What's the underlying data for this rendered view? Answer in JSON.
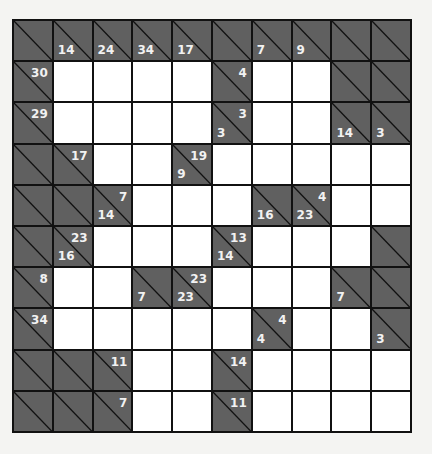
{
  "puzzle": {
    "type": "kakuro",
    "rows": 10,
    "cols": 10,
    "colors": {
      "block": "#606060",
      "empty": "#ffffff",
      "grid": "#111111",
      "clue_text": "#f2f2f2"
    },
    "grid": [
      [
        {
          "b": 1
        },
        {
          "b": 1,
          "d": "14"
        },
        {
          "b": 1,
          "d": "24"
        },
        {
          "b": 1,
          "d": "34"
        },
        {
          "b": 1,
          "d": "17"
        },
        {
          "b": 1
        },
        {
          "b": 1,
          "d": "7"
        },
        {
          "b": 1,
          "d": "9"
        },
        {
          "b": 1
        },
        {
          "b": 1
        }
      ],
      [
        {
          "b": 1,
          "a": "30"
        },
        {},
        {},
        {},
        {},
        {
          "b": 1,
          "a": "4"
        },
        {},
        {},
        {
          "b": 1
        },
        {
          "b": 1
        }
      ],
      [
        {
          "b": 1,
          "a": "29"
        },
        {},
        {},
        {},
        {},
        {
          "b": 1,
          "d": "3",
          "a": "3"
        },
        {},
        {},
        {
          "b": 1,
          "d": "14"
        },
        {
          "b": 1,
          "d": "3"
        }
      ],
      [
        {
          "b": 1
        },
        {
          "b": 1,
          "a": "17"
        },
        {},
        {},
        {
          "b": 1,
          "d": "9",
          "a": "19"
        },
        {},
        {},
        {},
        {},
        {}
      ],
      [
        {
          "b": 1
        },
        {
          "b": 1
        },
        {
          "b": 1,
          "d": "14",
          "a": "7"
        },
        {},
        {},
        {},
        {
          "b": 1,
          "d": "16"
        },
        {
          "b": 1,
          "d": "23",
          "a": "4"
        },
        {},
        {}
      ],
      [
        {
          "b": 1
        },
        {
          "b": 1,
          "d": "16",
          "a": "23"
        },
        {},
        {},
        {},
        {
          "b": 1,
          "d": "14",
          "a": "13"
        },
        {},
        {},
        {},
        {
          "b": 1
        }
      ],
      [
        {
          "b": 1,
          "a": "8"
        },
        {},
        {},
        {
          "b": 1,
          "d": "7"
        },
        {
          "b": 1,
          "d": "23",
          "a": "23"
        },
        {},
        {},
        {},
        {
          "b": 1,
          "d": "7"
        },
        {
          "b": 1
        }
      ],
      [
        {
          "b": 1,
          "a": "34"
        },
        {},
        {},
        {},
        {},
        {},
        {
          "b": 1,
          "d": "4",
          "a": "4"
        },
        {},
        {},
        {
          "b": 1,
          "d": "3"
        }
      ],
      [
        {
          "b": 1
        },
        {
          "b": 1
        },
        {
          "b": 1,
          "a": "11"
        },
        {},
        {},
        {
          "b": 1,
          "a": "14"
        },
        {},
        {},
        {},
        {}
      ],
      [
        {
          "b": 1
        },
        {
          "b": 1
        },
        {
          "b": 1,
          "a": "7"
        },
        {},
        {},
        {
          "b": 1,
          "a": "11"
        },
        {},
        {},
        {},
        {}
      ]
    ]
  }
}
